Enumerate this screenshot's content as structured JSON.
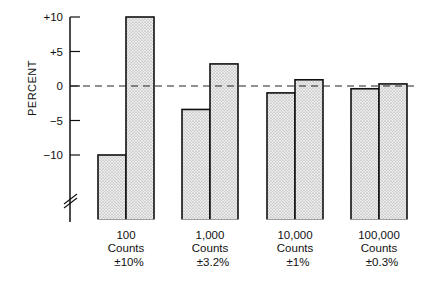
{
  "chart_data": {
    "type": "bar",
    "title": "",
    "xlabel": "",
    "ylabel": "PERCENT",
    "ylim": [
      -13,
      10
    ],
    "yticks": [
      10,
      5,
      0,
      -5,
      -10
    ],
    "ytick_labels": [
      "+10",
      "+5",
      "0",
      "−5",
      "−10"
    ],
    "axis_break": true,
    "reference_line": {
      "y": 0,
      "style": "dashed"
    },
    "grid": false,
    "legend": null,
    "categories": [
      {
        "count": "100",
        "unit": "Counts",
        "error": "±10%"
      },
      {
        "count": "1,000",
        "unit": "Counts",
        "error": "±3.2%"
      },
      {
        "count": "10,000",
        "unit": "Counts",
        "error": "±1%"
      },
      {
        "count": "100,000",
        "unit": "Counts",
        "error": "±0.3%"
      }
    ],
    "series": [
      {
        "name": "low",
        "values": [
          -10,
          -3.4,
          -1.0,
          -0.4
        ]
      },
      {
        "name": "high",
        "values": [
          10,
          3.2,
          0.9,
          0.3
        ]
      }
    ],
    "bar_fill": "#d9d9d9",
    "bar_stroke": "#111111"
  }
}
